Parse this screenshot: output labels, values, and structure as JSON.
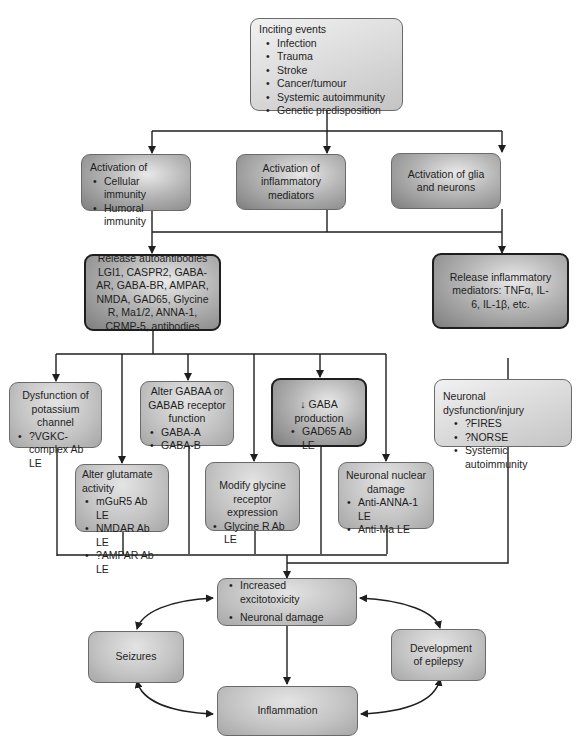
{
  "inciting": {
    "title": "Inciting events",
    "items": [
      "Infection",
      "Trauma",
      "Stroke",
      "Cancer/tumour",
      "Systemic autoimmunity",
      "Genetic predisposition"
    ]
  },
  "activation": {
    "immunity": {
      "title": "Activation of",
      "items": [
        "Cellular immunity",
        "Humoral immunity"
      ]
    },
    "inflammatory": {
      "title": "Activation of inflammatory mediators"
    },
    "glia": {
      "title": "Activation of glia and neurons"
    }
  },
  "release_autoantibodies": {
    "title": "Release autoantibodies",
    "text": "LGI1, CASPR2, GABA-AR, GABA-BR, AMPAR, NMDA, GAD65, Glycine R, Ma1/2, ANNA-1, CRMP-5, antibodies"
  },
  "release_inflammatory": {
    "text": "Release inflammatory mediators: TNFα, IL-6, IL-1β, etc."
  },
  "mechanisms": {
    "potassium": {
      "title": "Dysfunction of potassium channel",
      "items": [
        "?VGKC-complex Ab LE"
      ]
    },
    "glutamate": {
      "title": "Alter glutamate activity",
      "items": [
        "mGuR5 Ab LE",
        "NMDAR Ab LE",
        "?AMPAR Ab LE"
      ]
    },
    "gaba_receptor": {
      "title": "Alter GABAA or GABAB receptor function",
      "items": [
        "GABA-A",
        "GABA-B"
      ]
    },
    "glycine": {
      "title": "Modify glycine receptor expression",
      "items": [
        "Glycine R  Ab LE"
      ]
    },
    "gaba_production": {
      "title": "↓ GABA production",
      "items": [
        "GAD65 Ab LE"
      ]
    },
    "nuclear": {
      "title": "Neuronal nuclear damage",
      "items": [
        "Anti-ANNA-1 LE",
        "Anti-Ma LE"
      ]
    },
    "neuronal_injury": {
      "title": "Neuronal dysfunction/injury",
      "items": [
        "?FIRES",
        "?NORSE",
        "Systemic autoimmunity"
      ]
    }
  },
  "outcomes": {
    "excitotoxicity": {
      "items": [
        "Increased excitotoxicity",
        "Neuronal damage"
      ]
    },
    "seizures": {
      "title": "Seizures"
    },
    "epilepsy": {
      "title": "Development of epilepsy"
    },
    "inflammation": {
      "title": "Inflammation"
    }
  }
}
